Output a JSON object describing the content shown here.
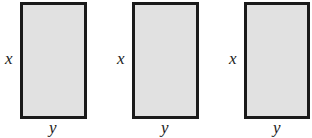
{
  "figure": {
    "fill_color": "#e1e1e1",
    "border_color": "#1a1a1a",
    "rectangles": [
      {
        "side_label": "x",
        "bottom_label": "y"
      },
      {
        "side_label": "x",
        "bottom_label": "y"
      },
      {
        "side_label": "x",
        "bottom_label": "y"
      }
    ]
  }
}
